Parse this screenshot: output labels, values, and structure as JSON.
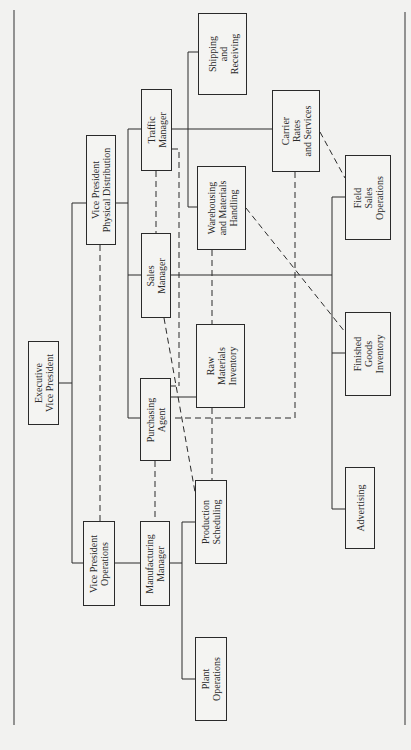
{
  "chart": {
    "type": "organization-chart",
    "orientation": "rotated-90-counterclockwise",
    "line_color": "#2a2a2a",
    "background": "#f2f2f0"
  },
  "nodes": {
    "executive_vp": {
      "label": "Executive\nVice President",
      "x": 28,
      "y": 341,
      "w": 31,
      "h": 84
    },
    "vp_physical_distribution": {
      "label": "Vice President\nPhysical Distribution",
      "x": 86,
      "y": 135,
      "w": 30,
      "h": 110
    },
    "vp_operations": {
      "label": "Vice President\nOperations",
      "x": 83,
      "y": 521,
      "w": 32,
      "h": 85
    },
    "traffic_manager": {
      "label": "Traffic\nManager",
      "x": 141,
      "y": 89,
      "w": 31,
      "h": 82
    },
    "sales_manager": {
      "label": "Sales\nManager",
      "x": 141,
      "y": 233,
      "w": 30,
      "h": 85
    },
    "purchasing_agent": {
      "label": "Purchasing\nAgent",
      "x": 140,
      "y": 378,
      "w": 31,
      "h": 83
    },
    "manufacturing_manager": {
      "label": "Manufacturing\nManager",
      "x": 140,
      "y": 521,
      "w": 30,
      "h": 85
    },
    "shipping_receiving": {
      "label": "Shipping\nand\nReceiving",
      "x": 198,
      "y": 13,
      "w": 49,
      "h": 82
    },
    "warehousing": {
      "label": "Warehousing\nand Materials\nHandling",
      "x": 197,
      "y": 166,
      "w": 49,
      "h": 84
    },
    "raw_materials_inventory": {
      "label": "Raw\nMaterials\nInventory",
      "x": 196,
      "y": 324,
      "w": 49,
      "h": 84
    },
    "production_scheduling": {
      "label": "Production\nScheduling",
      "x": 195,
      "y": 480,
      "w": 32,
      "h": 84
    },
    "plant_operations": {
      "label": "Plant\nOperations",
      "x": 195,
      "y": 637,
      "w": 32,
      "h": 84
    },
    "carrier_rates": {
      "label": "Carrier\nRates\nand Services",
      "x": 272,
      "y": 90,
      "w": 48,
      "h": 82
    },
    "field_sales_operations": {
      "label": "Field\nSales\nOperations",
      "x": 345,
      "y": 155,
      "w": 46,
      "h": 85
    },
    "finished_goods_inventory": {
      "label": "Finished\nGoods\nInventory",
      "x": 345,
      "y": 312,
      "w": 46,
      "h": 84
    },
    "advertising": {
      "label": "Advertising",
      "x": 345,
      "y": 467,
      "w": 30,
      "h": 82
    }
  },
  "solid_connections": [
    [
      "executive_vp",
      "vp_physical_distribution"
    ],
    [
      "executive_vp",
      "vp_operations"
    ],
    [
      "vp_physical_distribution",
      "traffic_manager"
    ],
    [
      "vp_physical_distribution",
      "sales_manager"
    ],
    [
      "vp_physical_distribution",
      "purchasing_agent"
    ],
    [
      "vp_operations",
      "manufacturing_manager"
    ],
    [
      "traffic_manager",
      "shipping_receiving"
    ],
    [
      "traffic_manager",
      "warehousing"
    ],
    [
      "traffic_manager",
      "carrier_rates"
    ],
    [
      "sales_manager",
      "field_sales_operations"
    ],
    [
      "sales_manager",
      "finished_goods_inventory"
    ],
    [
      "sales_manager",
      "advertising"
    ],
    [
      "purchasing_agent",
      "raw_materials_inventory"
    ],
    [
      "manufacturing_manager",
      "production_scheduling"
    ],
    [
      "manufacturing_manager",
      "plant_operations"
    ]
  ],
  "dashed_connections": [
    [
      "vp_physical_distribution",
      "vp_operations"
    ],
    [
      "traffic_manager",
      "sales_manager"
    ],
    [
      "purchasing_agent",
      "manufacturing_manager"
    ],
    [
      "warehousing",
      "raw_materials_inventory"
    ],
    [
      "raw_materials_inventory",
      "production_scheduling"
    ],
    [
      "traffic_manager",
      "purchasing_agent"
    ],
    [
      "sales_manager",
      "production_scheduling"
    ],
    [
      "warehousing",
      "finished_goods_inventory"
    ],
    [
      "carrier_rates",
      "field_sales_operations"
    ],
    [
      "carrier_rates",
      "purchasing_agent"
    ]
  ]
}
